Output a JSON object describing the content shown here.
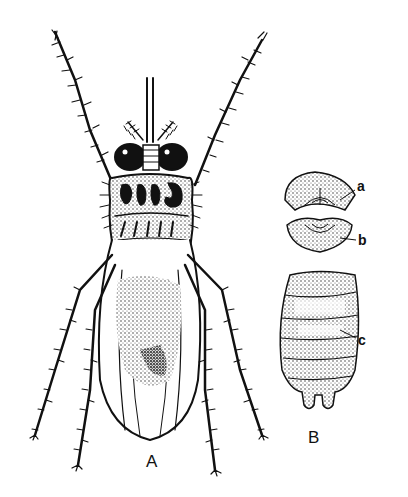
{
  "figure": {
    "background": "#ffffff",
    "ink": "#111111"
  },
  "labels": {
    "panel_a": "A",
    "panel_b": "B",
    "part_a": "a",
    "part_b": "b",
    "part_c": "c"
  }
}
